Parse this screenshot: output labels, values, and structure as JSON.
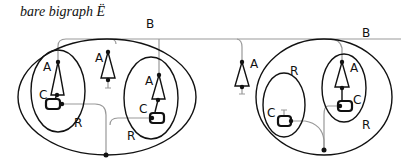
{
  "title": "bare bigraph Ë",
  "labels": {
    "root_left": "B",
    "root_right": "B",
    "A1": "A",
    "A2": "A",
    "A3": "A",
    "A4": "A",
    "A5": "A",
    "C1": "C",
    "C2": "C",
    "C3": "C",
    "C4": "C",
    "R1": "R",
    "R2": "R",
    "R3": "R",
    "R4": "R"
  },
  "colors": {
    "stroke": "#111111",
    "link": "#999999",
    "background": "#ffffff"
  }
}
